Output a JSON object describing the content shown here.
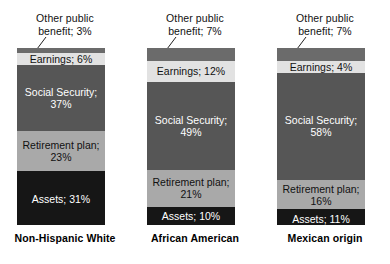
{
  "chart_data": {
    "type": "bar",
    "title": "",
    "subtitle": "",
    "xlabel": "",
    "ylabel": "",
    "ylim": [
      0,
      100
    ],
    "grid": false,
    "legend": "none",
    "stacked": true,
    "orientation": "vertical",
    "note": "100% stacked bars: sources of income share by group; top segment labeled with an external callout and leader line",
    "categories": [
      "Non-Hispanic White",
      "African American",
      "Mexican origin"
    ],
    "series": [
      {
        "name": "Other public benefit",
        "values": [
          3,
          7,
          7
        ],
        "color": "#6b6b6b"
      },
      {
        "name": "Earnings",
        "values": [
          6,
          12,
          4
        ],
        "color": "#e2e2e2"
      },
      {
        "name": "Social Security",
        "values": [
          37,
          49,
          58
        ],
        "color": "#565656"
      },
      {
        "name": "Retirement plan",
        "values": [
          23,
          21,
          16
        ],
        "color": "#a9a9a9"
      },
      {
        "name": "Assets",
        "values": [
          31,
          10,
          11
        ],
        "color": "#161616"
      }
    ]
  },
  "columns": [
    {
      "group_label": "Non-Hispanic White",
      "callout": "Other public\nbenefit; 3%",
      "segments": [
        {
          "name": "Other public benefit",
          "label": "",
          "value": 3,
          "percent_text": "3%",
          "color": "#6b6b6b",
          "text_color": "#ffffff"
        },
        {
          "name": "Earnings",
          "label": "Earnings; 6%",
          "value": 6,
          "percent_text": "6%",
          "color": "#e2e2e2",
          "text_color": "#111111"
        },
        {
          "name": "Social Security",
          "label": "Social Security;\n37%",
          "value": 37,
          "percent_text": "37%",
          "color": "#565656",
          "text_color": "#ffffff"
        },
        {
          "name": "Retirement plan",
          "label": "Retirement plan;\n23%",
          "value": 23,
          "percent_text": "23%",
          "color": "#a9a9a9",
          "text_color": "#111111"
        },
        {
          "name": "Assets",
          "label": "Assets; 31%",
          "value": 31,
          "percent_text": "31%",
          "color": "#161616",
          "text_color": "#ffffff"
        }
      ]
    },
    {
      "group_label": "African American",
      "callout": "Other public\nbenefit; 7%",
      "segments": [
        {
          "name": "Other public benefit",
          "label": "",
          "value": 7,
          "percent_text": "7%",
          "color": "#6b6b6b",
          "text_color": "#ffffff"
        },
        {
          "name": "Earnings",
          "label": "Earnings; 12%",
          "value": 12,
          "percent_text": "12%",
          "color": "#e2e2e2",
          "text_color": "#111111"
        },
        {
          "name": "Social Security",
          "label": "Social Security;\n49%",
          "value": 49,
          "percent_text": "49%",
          "color": "#565656",
          "text_color": "#ffffff"
        },
        {
          "name": "Retirement plan",
          "label": "Retirement plan;\n21%",
          "value": 21,
          "percent_text": "21%",
          "color": "#a9a9a9",
          "text_color": "#111111"
        },
        {
          "name": "Assets",
          "label": "Assets; 10%",
          "value": 10,
          "percent_text": "10%",
          "color": "#161616",
          "text_color": "#ffffff"
        }
      ]
    },
    {
      "group_label": "Mexican origin",
      "callout": "Other public\nbenefit; 7%",
      "segments": [
        {
          "name": "Other public benefit",
          "label": "",
          "value": 7,
          "percent_text": "7%",
          "color": "#6b6b6b",
          "text_color": "#ffffff"
        },
        {
          "name": "Earnings",
          "label": "Earnings; 4%",
          "value": 4,
          "percent_text": "4%",
          "color": "#e2e2e2",
          "text_color": "#111111"
        },
        {
          "name": "Social Security",
          "label": "Social Security;\n58%",
          "value": 58,
          "percent_text": "58%",
          "color": "#565656",
          "text_color": "#ffffff"
        },
        {
          "name": "Retirement plan",
          "label": "Retirement plan;\n16%",
          "value": 16,
          "percent_text": "16%",
          "color": "#a9a9a9",
          "text_color": "#111111"
        },
        {
          "name": "Assets",
          "label": "Assets; 11%",
          "value": 11,
          "percent_text": "11%",
          "color": "#161616",
          "text_color": "#ffffff"
        }
      ]
    }
  ]
}
